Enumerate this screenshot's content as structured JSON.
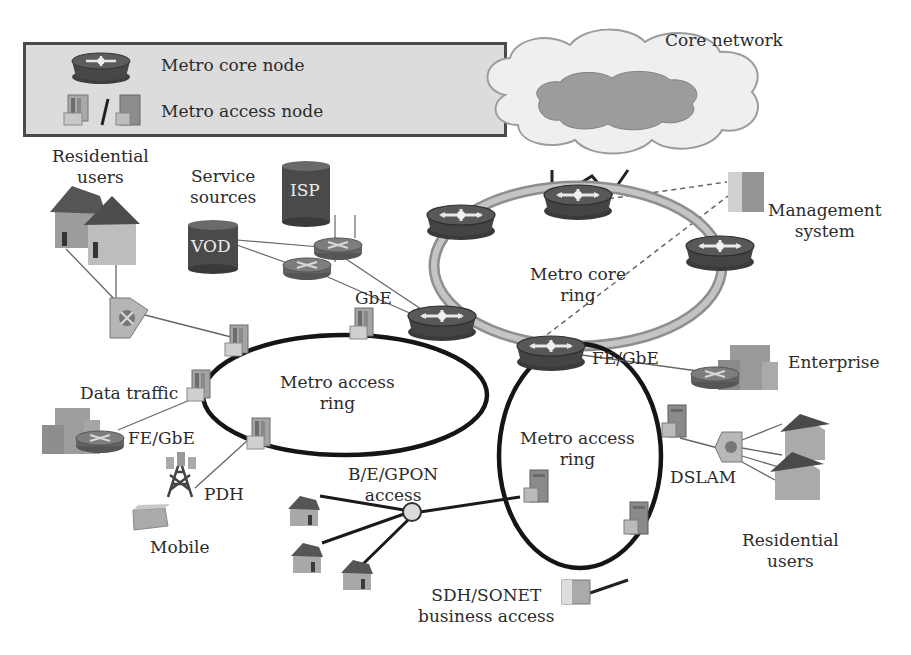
{
  "legend": {
    "items": [
      {
        "icon": "metro-core-node-icon",
        "label": "Metro core node"
      },
      {
        "icon": "metro-access-node-icon",
        "label": "Metro access node",
        "separator": "/"
      }
    ]
  },
  "labels": {
    "core_network": "Core network",
    "management_system": [
      "Management",
      "system"
    ],
    "metro_core_ring": [
      "Metro core",
      "ring"
    ],
    "residential_users_top": [
      "Residential",
      "users"
    ],
    "service_sources": [
      "Service",
      "sources"
    ],
    "isp": "ISP",
    "vod": "VOD",
    "gbe": "GbE",
    "metro_access_ring_left": [
      "Metro access",
      "ring"
    ],
    "data_traffic": "Data traffic",
    "fe_gbe_left": "FE/GbE",
    "pdh": "PDH",
    "mobile": "Mobile",
    "fe_gbe_right": "FE/GbE",
    "enterprise": "Enterprise",
    "metro_access_ring_right": [
      "Metro access",
      "ring"
    ],
    "dslam": "DSLAM",
    "residential_users_bottom": [
      "Residential",
      "users"
    ],
    "bgpon_access": [
      "B/E/GPON",
      "access"
    ],
    "sdh_sonet": [
      "SDH/SONET",
      "business access"
    ]
  },
  "colors": {
    "core_node_body": "#4a4a4a",
    "core_node_top": "#5a5a5a",
    "core_ring": "#a8a8a8",
    "access_ring": "#1a1a1a",
    "legend_bg": "#dcdcdc",
    "cloud_outer": "#eeeeee",
    "cloud_inner": "#9a9a9a",
    "text": "#2b2b2b"
  }
}
